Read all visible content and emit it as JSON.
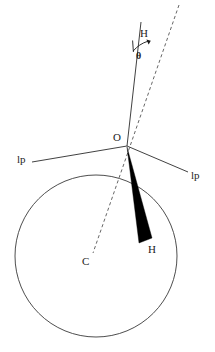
{
  "figure": {
    "background_color": "#ffffff",
    "width": 215,
    "height": 352
  },
  "labels": {
    "origin": "O",
    "center": "C",
    "axis_top": "H",
    "wedge_bottom": "H",
    "angle": "θ",
    "lp_left": "lp",
    "lp_right": "lp"
  },
  "colors": {
    "line": "#2b2b2b",
    "dashed_line": "#555555",
    "circle": "#3a3a3a",
    "wedge": "#000000",
    "text": "#1c1c1c",
    "background": "#ffffff"
  },
  "geometry": {
    "circle": {
      "cx": 96,
      "cy": 256,
      "r": 81
    },
    "origin_point": {
      "x": 127,
      "y": 146
    },
    "center_point": {
      "x": 96,
      "y": 256
    },
    "axis_line": {
      "x1": 141,
      "y1": 22,
      "x2": 127,
      "y2": 146
    },
    "dashed_line": {
      "x1": 179,
      "y1": 5,
      "x2": 93,
      "y2": 253
    },
    "lp_left_line": {
      "x1": 32,
      "y1": 162,
      "x2": 127,
      "y2": 146
    },
    "lp_right_line": {
      "x1": 127,
      "y1": 146,
      "x2": 188,
      "y2": 172
    },
    "wedge": {
      "apex_x": 127,
      "apex_y": 147,
      "base_left_x": 139,
      "base_left_y": 243,
      "base_right_x": 152,
      "base_right_y": 238
    },
    "angle_arc": {
      "cx": 136,
      "cy": 21,
      "r": 30,
      "start_deg": 84,
      "end_deg": 63
    }
  },
  "label_positions": {
    "origin": {
      "x": 113,
      "y": 132
    },
    "center": {
      "x": 82,
      "y": 256
    },
    "axis_top": {
      "x": 140,
      "y": 28
    },
    "wedge_bottom": {
      "x": 148,
      "y": 244
    },
    "angle": {
      "x": 136,
      "y": 50
    },
    "lp_left": {
      "x": 17,
      "y": 154
    },
    "lp_right": {
      "x": 191,
      "y": 170
    }
  }
}
